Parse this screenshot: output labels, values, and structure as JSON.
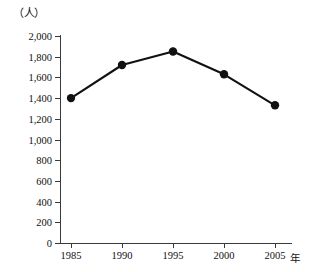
{
  "chart_data": {
    "type": "line",
    "title": "",
    "subtitle": "",
    "xlabel": "年",
    "ylabel": "（人）",
    "categories": [
      "1985",
      "1990",
      "1995",
      "2000",
      "2005"
    ],
    "x": [
      1985,
      1990,
      1995,
      2000,
      2005
    ],
    "values": [
      1400,
      1720,
      1850,
      1630,
      1330
    ],
    "series": [
      {
        "name": "人数",
        "values": [
          1400,
          1720,
          1850,
          1630,
          1330
        ]
      }
    ],
    "ylim": [
      0,
      2000
    ],
    "ytick_values": [
      0,
      200,
      400,
      600,
      800,
      1000,
      1200,
      1400,
      1600,
      1800,
      2000
    ],
    "ytick_labels": [
      "0",
      "200",
      "400",
      "600",
      "800",
      "1,000",
      "1,200",
      "1,400",
      "1,600",
      "1,800",
      "2,000"
    ],
    "xtick_labels": [
      "1985",
      "1990",
      "1995",
      "2000",
      "2005"
    ],
    "grid": false,
    "legend": "none",
    "marker": "filled-circle",
    "line_color": "#111111",
    "axis_color": "#3a3a3a",
    "background_color": "#ffffff"
  },
  "axes": {
    "y_unit": "（人）",
    "x_unit": "年"
  }
}
